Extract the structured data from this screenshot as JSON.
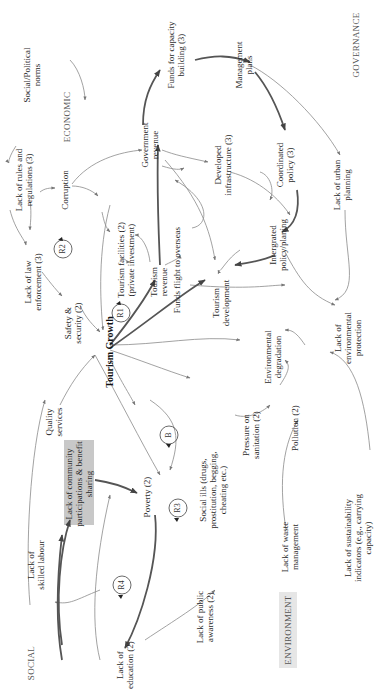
{
  "diagram": {
    "orientation": "rotated 90 degrees counter-clockwise",
    "sectors": {
      "economic": "ECONOMIC",
      "governance": "GOVERNANCE",
      "social": "SOCIAL",
      "environment": "ENVIRONMENT"
    },
    "nodes": {
      "social_political_norms": [
        "Social/Political",
        "norms"
      ],
      "lack_rules": [
        "Lack of rules and",
        "regulations (3)"
      ],
      "corruption": [
        "Corruption"
      ],
      "government_revenue": [
        "Government",
        "revenue"
      ],
      "funds_capacity": [
        "Funds for capacity",
        "building (3)"
      ],
      "management_plans": [
        "Management",
        "plans"
      ],
      "coordinated_policy": [
        "Coordinated",
        "policy (3)"
      ],
      "lack_urban_planning": [
        "Lack of urban",
        "planning"
      ],
      "developed_infrastructure": [
        "Developed",
        "infrastructure (3)"
      ],
      "tourism_facilities": [
        "Tourism facilities (2)",
        "(private investment)"
      ],
      "tourism_revenue": [
        "Tourism",
        "revenue"
      ],
      "funds_flight": [
        "Funds flight to overseas"
      ],
      "tourism_development": [
        "Tourism",
        "development"
      ],
      "integrated_policy": [
        "Intergrated",
        "policy/planing"
      ],
      "lack_law_enforcement": [
        "Lack of law",
        "enforcement (3)"
      ],
      "safety_security": [
        "Safety &",
        "security (2)"
      ],
      "tourism_growth": [
        "Tourism Growth"
      ],
      "environmental_degradation": [
        "Environmental",
        "degradation"
      ],
      "lack_env_protection": [
        "Lack of",
        "environmental",
        "protection"
      ],
      "quality_services": [
        "Quality",
        "services"
      ],
      "pressure_sanitation": [
        "Pressure on",
        "sanitation (2)"
      ],
      "pollution": [
        "Pollution (2)"
      ],
      "lack_community": [
        "Lack of community",
        "participations & benefit",
        "sharing"
      ],
      "poverty": [
        "Poverty (2)"
      ],
      "social_ills": [
        "Social ills (drugs,",
        "prostitution, begging,",
        "cheating etc.)"
      ],
      "lack_waste": [
        "Lack of waste",
        "management"
      ],
      "lack_sustainability": [
        "Lack of sustainability",
        "indicators (e.g., carrying",
        "capacity)"
      ],
      "lack_skilled_labour": [
        "Lack of",
        "skilled labour"
      ],
      "lack_public_awareness": [
        "Lack of public",
        "awareness (2)"
      ],
      "lack_education": [
        "Lack of",
        "education (2)"
      ]
    },
    "loops": {
      "r1": "R1",
      "r2": "R2",
      "r3": "R3",
      "r4": "R4",
      "b": "B"
    },
    "colors": {
      "arrow_thin": "#8a8a8a",
      "arrow_thick": "#555555",
      "highlight_box": "#c8c8c8",
      "sector_box": "#e6e6e6"
    }
  }
}
